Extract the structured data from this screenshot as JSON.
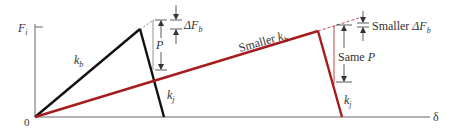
{
  "diagram": {
    "colors": {
      "axis": "#555555",
      "stiff_bolt": "#111111",
      "soft_bolt": "#a61c1c",
      "dashed": "#a61c1c",
      "annotation": "#333333"
    },
    "axes": {
      "y_label": "F",
      "y_label_sub": "i",
      "x_label": "δ",
      "origin_label": "0"
    },
    "left_case": {
      "bolt_stiffness_label": "k",
      "bolt_stiffness_sub": "b",
      "joint_stiffness_label": "k",
      "joint_stiffness_sub": "j",
      "load_label": "P",
      "delta_label": "ΔF",
      "delta_sub": "b"
    },
    "right_case": {
      "bolt_stiffness_prefix": "Smaller ",
      "bolt_stiffness_label": "k",
      "bolt_stiffness_sub": "b",
      "joint_stiffness_label": "k",
      "joint_stiffness_sub": "j",
      "load_prefix": "Same ",
      "load_label": "P",
      "delta_prefix": "Smaller ",
      "delta_label": "ΔF",
      "delta_sub": "b"
    }
  }
}
